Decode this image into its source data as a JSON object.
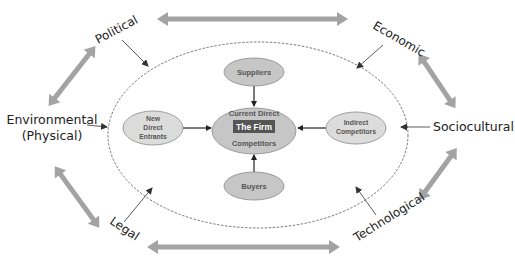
{
  "diagram": {
    "center": {
      "top_label": "Current Direct",
      "firm_label": "The Firm",
      "bottom_label": "Competitors"
    },
    "inner_forces": {
      "suppliers": "Suppliers",
      "buyers": "Buyers",
      "new_entrants_line1": "New",
      "new_entrants_line2": "Direct",
      "new_entrants_line3": "Entrants",
      "indirect_line1": "Indirect",
      "indirect_line2": "Competitors"
    },
    "external_forces": {
      "political": "Political",
      "economic": "Economic",
      "environmental_line1": "Environmental",
      "environmental_line2": "(Physical)",
      "sociocultural": "Sociocultural",
      "legal": "Legal",
      "technological": "Technological"
    },
    "colors": {
      "inner_fill": "#c6c6c6",
      "inner_stroke": "#8a8a8a",
      "firm_box": "#555555",
      "thick_arrow": "#a3a3a3",
      "thin_arrow": "#333333",
      "dashed_boundary": "#555555",
      "text": "#222222"
    }
  }
}
